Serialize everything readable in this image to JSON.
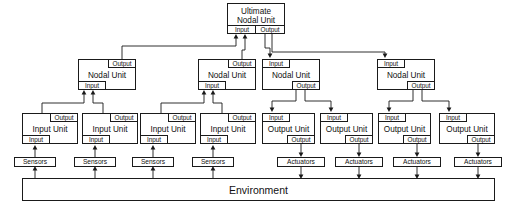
{
  "diagram": {
    "line_color": "#1a1a1a",
    "background": "#ffffff"
  },
  "ports": {
    "input": "Input",
    "output": "Output"
  },
  "ultimate": {
    "title_line1": "Ultimate",
    "title_line2": "Nodal Unit",
    "input_label": "Input",
    "output_label": "Output"
  },
  "nodal_units": [
    {
      "title": "Nodal Unit",
      "top_right_port": "Output",
      "bottom_left_port": "Input"
    },
    {
      "title": "Nodal Unit",
      "top_right_port": "Output",
      "bottom_left_port": "Input"
    },
    {
      "title": "Nodal Unit",
      "top_left_port": "Input",
      "bottom_right_port": "Output"
    },
    {
      "title": "Nodal Unit",
      "top_left_port": "Input",
      "bottom_right_port": "Output"
    }
  ],
  "leaf_units": [
    {
      "title": "Input Unit",
      "top_right_port": "Output",
      "bottom_left_port": "Input"
    },
    {
      "title": "Input Unit",
      "top_right_port": "Output",
      "bottom_left_port": "Input"
    },
    {
      "title": "Input Unit",
      "top_right_port": "Output",
      "bottom_left_port": "Input"
    },
    {
      "title": "Input Unit",
      "top_right_port": "Output",
      "bottom_left_port": "Input"
    },
    {
      "title": "Output Unit",
      "top_left_port": "Input",
      "bottom_right_port": "Output"
    },
    {
      "title": "Output Unit",
      "top_left_port": "Input",
      "bottom_right_port": "Output"
    },
    {
      "title": "Output Unit",
      "top_left_port": "Input",
      "bottom_right_port": "Output"
    },
    {
      "title": "Output Unit",
      "top_left_port": "Input",
      "bottom_right_port": "Output"
    }
  ],
  "transducers": [
    {
      "label": "Sensors"
    },
    {
      "label": "Sensors"
    },
    {
      "label": "Sensors"
    },
    {
      "label": "Sensors"
    },
    {
      "label": "Actuators"
    },
    {
      "label": "Actuators"
    },
    {
      "label": "Actuators"
    },
    {
      "label": "Actuators"
    }
  ],
  "environment": {
    "label": "Environment"
  }
}
